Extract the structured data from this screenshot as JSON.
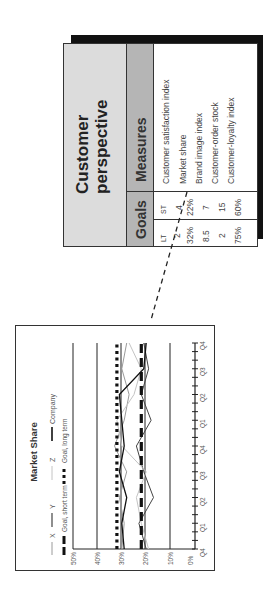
{
  "table": {
    "title_line1": "Customer",
    "title_line2": "perspective",
    "measures_header": "Measures",
    "goals_header": "Goals",
    "st_label": "ST",
    "lt_label": "LT",
    "rows": [
      {
        "measure": "Customer satisfaction index",
        "st": "4",
        "lt": "2"
      },
      {
        "measure": "Market share",
        "st": "22%",
        "lt": "32%"
      },
      {
        "measure": "Brand image index",
        "st": "7",
        "lt": "8.5"
      },
      {
        "measure": "Customer-order stock",
        "st": "15",
        "lt": "2"
      },
      {
        "measure": "Customer-loyalty index",
        "st": "60%",
        "lt": "75%"
      }
    ]
  },
  "colors": {
    "title_band": "#dcdcdc",
    "header_band": "#b5b5b5",
    "shadow": "#111111",
    "company": "#111111",
    "x_series": "#9a9a9a",
    "y_series": "#444444",
    "z_series": "#c4c4c4"
  },
  "chart_data": {
    "type": "line",
    "title": "Market Share",
    "xlabel": "",
    "ylabel": "",
    "orientation_note": "figure rotated 90 degrees counter-clockwise",
    "ylim": [
      0,
      50
    ],
    "y_ticks": [
      "0%",
      "10%",
      "20%",
      "30%",
      "40%",
      "50%"
    ],
    "x": [
      "Q4",
      "Q1",
      "Q2",
      "Q3",
      "Q4",
      "Q1",
      "Q2",
      "Q3",
      "Q4"
    ],
    "grid": true,
    "legend_position": "top",
    "legend": [
      "X",
      "Y",
      "Z",
      "Company",
      "Goal, short term",
      "Goal, long term"
    ],
    "series": [
      {
        "name": "X",
        "style": "thin light gray",
        "values": [
          30,
          29,
          31,
          28,
          33,
          29,
          27,
          30,
          28
        ]
      },
      {
        "name": "Y",
        "style": "thin dark",
        "values": [
          20,
          23,
          17,
          21,
          24,
          18,
          22,
          19,
          21
        ]
      },
      {
        "name": "Z",
        "style": "thin pale gray",
        "values": [
          19,
          22,
          24,
          20,
          30,
          32,
          25,
          22,
          27
        ]
      },
      {
        "name": "Company",
        "style": "solid black",
        "values": [
          29,
          30,
          28,
          31,
          29,
          30,
          31,
          21,
          20
        ]
      },
      {
        "name": "Goal, short term",
        "style": "long dash",
        "values": [
          22,
          22,
          22,
          22,
          22,
          22,
          22,
          22,
          22
        ]
      },
      {
        "name": "Goal, long term",
        "style": "dotted",
        "values": [
          32,
          32,
          32,
          32,
          32,
          32,
          32,
          32,
          32
        ]
      }
    ]
  }
}
